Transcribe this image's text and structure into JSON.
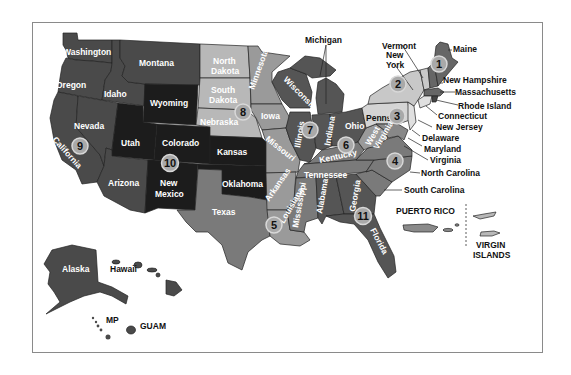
{
  "map": {
    "colors": {
      "very_dark": "#1c1c1c",
      "dark": "#3d3d3d",
      "mid_dark": "#555555",
      "mid": "#7a7a7a",
      "light_mid": "#9a9a9a",
      "light": "#b8b8b8",
      "very_light": "#d4d4d4",
      "outline": "#222222"
    },
    "states": [
      {
        "name": "Washington",
        "label": "Washington",
        "region": 10
      },
      {
        "name": "Oregon",
        "label": "Oregon",
        "region": 10
      },
      {
        "name": "Idaho",
        "label": "Idaho",
        "region": 10
      },
      {
        "name": "Montana",
        "label": "Montana",
        "region": 8
      },
      {
        "name": "Wyoming",
        "label": "Wyoming",
        "region": 8
      },
      {
        "name": "Nevada",
        "label": "Nevada",
        "region": 9
      },
      {
        "name": "California",
        "label": "California",
        "region": 9
      },
      {
        "name": "Utah",
        "label": "Utah",
        "region": 8
      },
      {
        "name": "Colorado",
        "label": "Colorado",
        "region": 8
      },
      {
        "name": "Arizona",
        "label": "Arizona",
        "region": 9
      },
      {
        "name": "New Mexico",
        "label": "New\nMexico",
        "region": 6
      },
      {
        "name": "North Dakota",
        "label": "North\nDakota",
        "region": 8
      },
      {
        "name": "South Dakota",
        "label": "South\nDakota",
        "region": 8
      },
      {
        "name": "Nebraska",
        "label": "Nebraska",
        "region": 7
      },
      {
        "name": "Kansas",
        "label": "Kansas",
        "region": 7
      },
      {
        "name": "Oklahoma",
        "label": "Oklahoma",
        "region": 6
      },
      {
        "name": "Texas",
        "label": "Texas",
        "region": 6
      },
      {
        "name": "Minnesota",
        "label": "Minnesota",
        "region": 5
      },
      {
        "name": "Iowa",
        "label": "Iowa",
        "region": 7
      },
      {
        "name": "Missouri",
        "label": "Missouri",
        "region": 7
      },
      {
        "name": "Arkansas",
        "label": "Arkansas",
        "region": 6
      },
      {
        "name": "Louisiana",
        "label": "Louisiana",
        "region": 6
      },
      {
        "name": "Wisconsin",
        "label": "Wisconsin",
        "region": 5
      },
      {
        "name": "Illinois",
        "label": "Illinois",
        "region": 5
      },
      {
        "name": "Michigan",
        "label": "Michigan",
        "region": 5
      },
      {
        "name": "Indiana",
        "label": "Indiana",
        "region": 5
      },
      {
        "name": "Ohio",
        "label": "Ohio",
        "region": 5
      },
      {
        "name": "Kentucky",
        "label": "Kentucky",
        "region": 4
      },
      {
        "name": "Tennessee",
        "label": "Tennessee",
        "region": 4
      },
      {
        "name": "Mississippi",
        "label": "Mississippi",
        "region": 4
      },
      {
        "name": "Alabama",
        "label": "Alabama",
        "region": 4
      },
      {
        "name": "Georgia",
        "label": "Georgia",
        "region": 4
      },
      {
        "name": "Florida",
        "label": "Florida",
        "region": 4
      },
      {
        "name": "South Carolina",
        "label": "South Carolina",
        "region": 4
      },
      {
        "name": "North Carolina",
        "label": "North Carolina",
        "region": 4
      },
      {
        "name": "Virginia",
        "label": "Virginia",
        "region": 3
      },
      {
        "name": "West Virginia",
        "label": "West\nVirginia",
        "region": 3
      },
      {
        "name": "Pennsylvania",
        "label": "Penns",
        "region": 3
      },
      {
        "name": "Maryland",
        "label": "Maryland",
        "region": 3
      },
      {
        "name": "Delaware",
        "label": "Delaware",
        "region": 3
      },
      {
        "name": "New Jersey",
        "label": "New Jersey",
        "region": 2
      },
      {
        "name": "New York",
        "label": "New\nYork",
        "region": 2
      },
      {
        "name": "Connecticut",
        "label": "Connecticut",
        "region": 1
      },
      {
        "name": "Rhode Island",
        "label": "Rhode Island",
        "region": 1
      },
      {
        "name": "Massachusetts",
        "label": "Massachusetts",
        "region": 1
      },
      {
        "name": "Vermont",
        "label": "Vermont",
        "region": 1
      },
      {
        "name": "New Hampshire",
        "label": "New Hampshire",
        "region": 1
      },
      {
        "name": "Maine",
        "label": "Maine",
        "region": 1
      },
      {
        "name": "Alaska",
        "label": "Alaska",
        "region": 10
      },
      {
        "name": "Hawaii",
        "label": "Hawaii",
        "region": 9
      }
    ],
    "territories": [
      {
        "name": "Puerto Rico",
        "label": "PUERTO RICO"
      },
      {
        "name": "Virgin Islands",
        "label": "VIRGIN\nISLANDS"
      },
      {
        "name": "Northern Mariana Islands",
        "label": "MP"
      },
      {
        "name": "Guam",
        "label": "GUAM"
      }
    ],
    "region_badges": [
      "1",
      "2",
      "3",
      "4",
      "5",
      "6",
      "7",
      "8",
      "9",
      "10",
      "11"
    ],
    "labels": {
      "washington": "Washington",
      "oregon": "Oregon",
      "idaho": "Idaho",
      "montana": "Montana",
      "wyoming": "Wyoming",
      "nevada": "Nevada",
      "california": "California",
      "utah": "Utah",
      "colorado": "Colorado",
      "arizona": "Arizona",
      "new_mexico_1": "New",
      "new_mexico_2": "Mexico",
      "north_dakota_1": "North",
      "north_dakota_2": "Dakota",
      "south_dakota_1": "South",
      "south_dakota_2": "Dakota",
      "nebraska": "Nebraska",
      "kansas": "Kansas",
      "oklahoma": "Oklahoma",
      "texas": "Texas",
      "minnesota": "Minnesota",
      "iowa": "Iowa",
      "missouri": "Missouri",
      "arkansas": "Arkansas",
      "louisiana": "Louisiana",
      "wisconsin": "Wisconsin",
      "illinois": "Illinois",
      "michigan": "Michigan",
      "indiana": "Indiana",
      "ohio": "Ohio",
      "kentucky": "Kentucky",
      "tennessee": "Tennessee",
      "mississippi": "Mississippi",
      "alabama": "Alabama",
      "georgia": "Georgia",
      "florida": "Florida",
      "south_carolina": "South Carolina",
      "north_carolina": "North Carolina",
      "virginia": "Virginia",
      "west_virginia_1": "West",
      "west_virginia_2": "Virginia",
      "pennsylvania": "Penns",
      "maryland": "Maryland",
      "delaware": "Delaware",
      "new_jersey": "New Jersey",
      "new_york_1": "New",
      "new_york_2": "York",
      "connecticut": "Connecticut",
      "rhode_island": "Rhode Island",
      "massachusetts": "Massachusetts",
      "vermont": "Vermont",
      "new_hampshire": "New Hampshire",
      "maine": "Maine",
      "alaska": "Alaska",
      "hawaii": "Hawaii",
      "puerto_rico": "PUERTO RICO",
      "virgin_islands_1": "VIRGIN",
      "virgin_islands_2": "ISLANDS",
      "mp": "MP",
      "guam": "GUAM"
    }
  }
}
